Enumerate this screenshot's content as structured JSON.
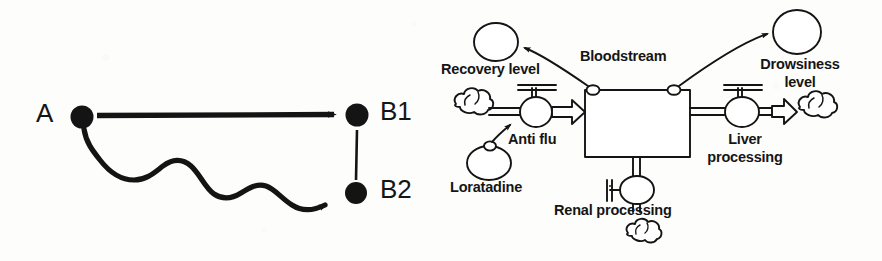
{
  "figure": {
    "background_color": "#fdfdfc",
    "ink_color": "#141414"
  },
  "left_diagram": {
    "name": "path-divergence-diagram",
    "nodes": [
      {
        "id": "A",
        "label": "A",
        "cx": 82,
        "cy": 117
      },
      {
        "id": "B1",
        "label": "B1",
        "cx": 357,
        "cy": 115
      },
      {
        "id": "B2",
        "label": "B2",
        "cx": 356,
        "cy": 193
      }
    ],
    "edges": [
      {
        "id": "straight-arrow",
        "from": "A",
        "to": "B1",
        "style": "straight",
        "arrow": true
      },
      {
        "id": "wavy-arrow",
        "from": "A",
        "to": "B2",
        "style": "wavy",
        "arrow": true
      },
      {
        "id": "gap-connector",
        "from": "B1",
        "to": "B2",
        "style": "thin-line",
        "arrow": false
      }
    ]
  },
  "right_diagram": {
    "name": "pharmacokinetics-stock-and-flow-diagram",
    "stock": {
      "label": "Bloodstream",
      "x": 585,
      "y": 90,
      "width": 105,
      "height": 67
    },
    "flows": [
      {
        "id": "anti-flu-flow",
        "label": "Anti flu",
        "direction": "in",
        "source": "source-cloud-left",
        "valve_cx": 536,
        "valve_cy": 112
      },
      {
        "id": "liver-processing-flow",
        "label": "Liver\nprocessing",
        "direction": "out",
        "sink": "sink-cloud-right",
        "valve_cx": 742,
        "valve_cy": 112
      },
      {
        "id": "renal-processing-flow",
        "label": "Renal processing",
        "direction": "out",
        "sink": "sink-cloud-bottom",
        "valve_cx": 637,
        "valve_cy": 190
      }
    ],
    "auxiliaries": [
      {
        "id": "loratadine",
        "label": "Loratadine",
        "cx": 489,
        "cy": 163,
        "rx": 22,
        "ry": 17
      },
      {
        "id": "recovery-level",
        "label": "Recovery level",
        "cx": 496,
        "cy": 42,
        "rx": 22,
        "ry": 19
      },
      {
        "id": "drowsiness-level",
        "label": "Drowsiness\nlevel",
        "cx": 797,
        "cy": 32,
        "rx": 24,
        "ry": 22
      }
    ],
    "links": [
      {
        "id": "loratadine-to-anti-flu-link",
        "from": "loratadine",
        "to": "anti-flu-flow",
        "arrow": true
      },
      {
        "id": "bloodstream-to-recovery-link",
        "from": "bloodstream",
        "to": "recovery-level",
        "arrow": true
      },
      {
        "id": "bloodstream-to-drowsiness-link",
        "from": "bloodstream",
        "to": "drowsiness-level",
        "arrow": true
      }
    ],
    "labels": {
      "bloodstream": "Bloodstream",
      "recovery_level": "Recovery level",
      "drowsiness_level_line1": "Drowsiness",
      "drowsiness_level_line2": "level",
      "anti_flu": "Anti flu",
      "loratadine": "Loratadine",
      "liver_line1": "Liver",
      "liver_line2": "processing",
      "renal": "Renal processing"
    }
  }
}
